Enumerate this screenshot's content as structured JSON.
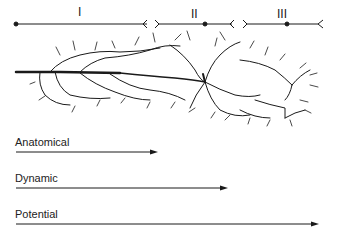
{
  "segments": [
    {
      "label": "I"
    },
    {
      "label": "II"
    },
    {
      "label": "III"
    }
  ],
  "arrows": [
    {
      "label": "Anatomical",
      "end_x": 158
    },
    {
      "label": "Dynamic",
      "end_x": 228
    },
    {
      "label": "Potential",
      "end_x": 320
    }
  ],
  "colors": {
    "ink": "#1a1a1a"
  }
}
